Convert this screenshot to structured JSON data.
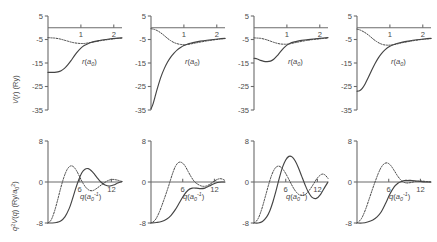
{
  "figure": {
    "rows": 2,
    "cols": 4,
    "background": "#ffffff",
    "line_color": "#444444",
    "axis_color": "#6b6b6b"
  },
  "axis_labels": {
    "top_y": "V(r) (Ry)",
    "top_y_parts": {
      "v": "V",
      "r": "r",
      "unit": "(Ry)"
    },
    "bottom_y": "q2V(q) (Ry/a02)",
    "bottom_x": "q(a0-1)",
    "top_x": "r(a0)"
  },
  "chart_data": [
    {
      "id": "top-1",
      "type": "line",
      "title": "",
      "xlabel": "r(a0)",
      "ylabel": "V(r) (Ry)",
      "xlim": [
        0,
        2.25
      ],
      "ylim": [
        -35,
        5
      ],
      "xticks": [
        1,
        2
      ],
      "xticklabels": [
        "1",
        "2"
      ],
      "yticks": [
        5,
        -5,
        -15,
        -25,
        -35
      ],
      "yticklabels": [
        "5",
        "-5",
        "-15",
        "-25",
        "-35"
      ],
      "grid": false,
      "series": [
        {
          "name": "pseudopotential",
          "style": "solid",
          "x": [
            0.0,
            0.1,
            0.2,
            0.3,
            0.4,
            0.5,
            0.6,
            0.7,
            0.8,
            0.9,
            1.0,
            1.1,
            1.2,
            1.3,
            1.4,
            1.5,
            1.6,
            1.75,
            1.9,
            2.05,
            2.25
          ],
          "y": [
            -19.0,
            -19.0,
            -19.0,
            -18.8,
            -18.3,
            -17.3,
            -15.8,
            -14.0,
            -12.0,
            -10.2,
            -8.7,
            -7.6,
            -6.9,
            -6.3,
            -5.9,
            -5.6,
            -5.3,
            -5.0,
            -4.7,
            -4.5,
            -4.3
          ]
        },
        {
          "name": "all-electron",
          "style": "dotted",
          "x": [
            0.0,
            0.1,
            0.2,
            0.3,
            0.4,
            0.5,
            0.6,
            0.7,
            0.8,
            0.9,
            1.0,
            1.1,
            1.2,
            1.3,
            1.4,
            1.5,
            1.6,
            1.75,
            1.9,
            2.05,
            2.25
          ],
          "y": [
            -4.2,
            -4.3,
            -4.4,
            -4.6,
            -4.9,
            -5.3,
            -5.7,
            -6.1,
            -6.4,
            -6.6,
            -6.7,
            -6.7,
            -6.5,
            -6.3,
            -6.0,
            -5.8,
            -5.5,
            -5.2,
            -4.9,
            -4.6,
            -4.4
          ]
        }
      ]
    },
    {
      "id": "top-2",
      "type": "line",
      "title": "",
      "xlabel": "r(a0)",
      "ylabel": "V(r) (Ry)",
      "xlim": [
        0,
        2.25
      ],
      "ylim": [
        -35,
        5
      ],
      "xticks": [
        1,
        2
      ],
      "xticklabels": [
        "1",
        "2"
      ],
      "yticks": [
        5,
        -5,
        -15,
        -25,
        -35
      ],
      "yticklabels": [
        "5",
        "-5",
        "-15",
        "-25",
        "-35"
      ],
      "grid": false,
      "series": [
        {
          "name": "pseudopotential",
          "style": "solid",
          "x": [
            0.0,
            0.06,
            0.12,
            0.2,
            0.3,
            0.4,
            0.5,
            0.6,
            0.7,
            0.8,
            0.9,
            1.0,
            1.1,
            1.2,
            1.35,
            1.5,
            1.7,
            1.9,
            2.1,
            2.25
          ],
          "y": [
            -34.5,
            -32.5,
            -29.5,
            -25.5,
            -21.0,
            -17.5,
            -14.7,
            -12.5,
            -10.8,
            -9.4,
            -8.4,
            -7.6,
            -7.0,
            -6.6,
            -6.1,
            -5.7,
            -5.3,
            -5.0,
            -4.7,
            -4.5
          ]
        },
        {
          "name": "all-electron",
          "style": "dotted",
          "x": [
            0.0,
            0.1,
            0.2,
            0.3,
            0.4,
            0.5,
            0.6,
            0.7,
            0.8,
            0.9,
            1.0,
            1.1,
            1.2,
            1.35,
            1.5,
            1.7,
            1.9,
            2.1,
            2.25
          ],
          "y": [
            -0.4,
            -0.7,
            -1.3,
            -2.2,
            -3.3,
            -4.5,
            -5.5,
            -6.3,
            -6.8,
            -7.1,
            -7.2,
            -7.1,
            -6.9,
            -6.5,
            -6.1,
            -5.6,
            -5.2,
            -4.8,
            -4.6
          ]
        }
      ]
    },
    {
      "id": "top-3",
      "type": "line",
      "title": "",
      "xlabel": "r(a0)",
      "ylabel": "V(r) (Ry)",
      "xlim": [
        0,
        2.25
      ],
      "ylim": [
        -35,
        5
      ],
      "xticks": [
        1,
        2
      ],
      "xticklabels": [
        "1",
        "2"
      ],
      "yticks": [
        5,
        -5,
        -15,
        -25,
        -35
      ],
      "yticklabels": [
        "5",
        "-5",
        "-15",
        "-25",
        "-35"
      ],
      "grid": false,
      "series": [
        {
          "name": "pseudopotential",
          "style": "solid",
          "x": [
            0.0,
            0.1,
            0.2,
            0.3,
            0.4,
            0.5,
            0.6,
            0.7,
            0.8,
            0.9,
            1.0,
            1.1,
            1.2,
            1.3,
            1.45,
            1.6,
            1.8,
            2.0,
            2.25
          ],
          "y": [
            -13.0,
            -13.3,
            -13.9,
            -14.3,
            -14.4,
            -14.2,
            -13.4,
            -12.0,
            -10.3,
            -8.7,
            -7.4,
            -6.6,
            -6.1,
            -5.8,
            -5.4,
            -5.1,
            -4.8,
            -4.5,
            -4.2
          ]
        },
        {
          "name": "all-electron",
          "style": "dotted",
          "x": [
            0.0,
            0.1,
            0.2,
            0.3,
            0.4,
            0.5,
            0.6,
            0.7,
            0.8,
            0.9,
            1.0,
            1.1,
            1.2,
            1.3,
            1.45,
            1.6,
            1.8,
            2.0,
            2.25
          ],
          "y": [
            -4.3,
            -4.4,
            -4.5,
            -4.8,
            -5.2,
            -5.7,
            -6.2,
            -6.6,
            -6.9,
            -7.0,
            -7.0,
            -6.8,
            -6.5,
            -6.2,
            -5.8,
            -5.4,
            -5.0,
            -4.7,
            -4.4
          ]
        }
      ]
    },
    {
      "id": "top-4",
      "type": "line",
      "title": "",
      "xlabel": "r(a0)",
      "ylabel": "V(r) (Ry)",
      "xlim": [
        0,
        2.25
      ],
      "ylim": [
        -35,
        5
      ],
      "xticks": [
        1,
        2
      ],
      "xticklabels": [
        "1",
        "2"
      ],
      "yticks": [
        5,
        -5,
        -15,
        -25,
        -35
      ],
      "yticklabels": [
        "5",
        "-5",
        "-15",
        "-25",
        "-35"
      ],
      "grid": false,
      "series": [
        {
          "name": "pseudopotential",
          "style": "solid",
          "x": [
            0.0,
            0.08,
            0.16,
            0.25,
            0.35,
            0.45,
            0.55,
            0.65,
            0.75,
            0.85,
            1.0,
            1.15,
            1.3,
            1.5,
            1.7,
            1.9,
            2.1,
            2.25
          ],
          "y": [
            -27.0,
            -26.8,
            -25.8,
            -23.8,
            -21.0,
            -18.0,
            -15.2,
            -12.8,
            -10.9,
            -9.4,
            -7.9,
            -7.0,
            -6.4,
            -5.8,
            -5.3,
            -5.0,
            -4.7,
            -4.5
          ]
        },
        {
          "name": "all-electron",
          "style": "dotted",
          "x": [
            0.0,
            0.1,
            0.2,
            0.3,
            0.4,
            0.5,
            0.6,
            0.7,
            0.8,
            0.9,
            1.0,
            1.1,
            1.25,
            1.4,
            1.6,
            1.85,
            2.1,
            2.25
          ],
          "y": [
            -0.6,
            -1.0,
            -1.7,
            -2.6,
            -3.7,
            -4.9,
            -5.9,
            -6.7,
            -7.2,
            -7.4,
            -7.4,
            -7.2,
            -6.8,
            -6.3,
            -5.8,
            -5.2,
            -4.8,
            -4.6
          ]
        }
      ]
    },
    {
      "id": "bottom-1",
      "type": "line",
      "title": "",
      "xlabel": "q(a0-1)",
      "ylabel": "q2V(q) (Ry/a02)",
      "xlim": [
        0,
        14
      ],
      "ylim": [
        -8,
        8
      ],
      "xticks": [
        6,
        12
      ],
      "xticklabels": [
        "6",
        "12"
      ],
      "yticks": [
        8,
        0,
        -8
      ],
      "yticklabels": [
        "8",
        "0",
        "-8"
      ],
      "grid": false,
      "series": [
        {
          "name": "pseudopotential",
          "style": "solid",
          "x": [
            0.0,
            0.8,
            1.6,
            2.4,
            3.2,
            4.0,
            4.6,
            5.2,
            5.8,
            6.4,
            7.0,
            7.6,
            8.2,
            8.8,
            9.4,
            10.0,
            10.8,
            11.6,
            12.4,
            13.2,
            14.0
          ],
          "y": [
            -8.0,
            -8.0,
            -7.9,
            -7.6,
            -6.8,
            -5.2,
            -3.4,
            -1.4,
            0.4,
            1.8,
            2.5,
            2.6,
            2.2,
            1.5,
            0.7,
            0.0,
            -0.6,
            -0.8,
            -0.6,
            -0.2,
            0.1
          ]
        },
        {
          "name": "all-electron",
          "style": "dotted",
          "x": [
            0.0,
            0.6,
            1.2,
            1.8,
            2.4,
            3.0,
            3.6,
            4.2,
            4.8,
            5.4,
            6.0,
            6.6,
            7.2,
            7.8,
            8.4,
            9.0,
            9.8,
            10.6,
            11.4,
            12.2,
            13.0,
            14.0
          ],
          "y": [
            -8.0,
            -7.4,
            -5.8,
            -3.6,
            -1.2,
            0.9,
            2.4,
            3.1,
            3.0,
            2.2,
            1.0,
            -0.2,
            -1.1,
            -1.6,
            -1.7,
            -1.4,
            -0.8,
            -0.2,
            0.3,
            0.5,
            0.4,
            0.1
          ]
        }
      ]
    },
    {
      "id": "bottom-2",
      "type": "line",
      "title": "",
      "xlabel": "q(a0-1)",
      "ylabel": "q2V(q) (Ry/a02)",
      "xlim": [
        0,
        14
      ],
      "ylim": [
        -8,
        8
      ],
      "xticks": [
        6,
        12
      ],
      "xticklabels": [
        "6",
        "12"
      ],
      "yticks": [
        8,
        0,
        -8
      ],
      "yticklabels": [
        "8",
        "0",
        "-8"
      ],
      "grid": false,
      "series": [
        {
          "name": "pseudopotential",
          "style": "solid",
          "x": [
            0.0,
            1.0,
            2.0,
            3.0,
            3.8,
            4.6,
            5.4,
            6.2,
            7.0,
            7.8,
            8.6,
            9.4,
            10.2,
            11.0,
            11.8,
            12.6,
            13.4,
            14.0
          ],
          "y": [
            -8.0,
            -7.9,
            -7.7,
            -7.2,
            -6.5,
            -5.4,
            -4.0,
            -2.6,
            -1.6,
            -1.2,
            -1.2,
            -1.3,
            -1.2,
            -0.8,
            -0.4,
            -0.1,
            0.0,
            0.0
          ]
        },
        {
          "name": "all-electron",
          "style": "dotted",
          "x": [
            0.0,
            0.8,
            1.6,
            2.4,
            3.2,
            4.0,
            4.6,
            5.2,
            5.8,
            6.4,
            7.0,
            7.6,
            8.2,
            8.8,
            9.6,
            10.4,
            11.2,
            12.0,
            12.8,
            13.4,
            14.0
          ],
          "y": [
            -8.0,
            -7.4,
            -5.8,
            -3.6,
            -1.2,
            1.4,
            3.0,
            3.8,
            3.8,
            3.2,
            2.1,
            1.0,
            0.1,
            -0.4,
            -0.8,
            -0.8,
            -0.4,
            0.2,
            0.6,
            0.6,
            0.3
          ]
        }
      ]
    },
    {
      "id": "bottom-3",
      "type": "line",
      "title": "",
      "xlabel": "q(a0-1)",
      "ylabel": "q2V(q) (Ry/a02)",
      "xlim": [
        0,
        14
      ],
      "ylim": [
        -8,
        8
      ],
      "xticks": [
        6,
        12
      ],
      "xticklabels": [
        "6",
        "12"
      ],
      "yticks": [
        8,
        0,
        -8
      ],
      "yticklabels": [
        "8",
        "0",
        "-8"
      ],
      "grid": false,
      "series": [
        {
          "name": "pseudopotential",
          "style": "solid",
          "x": [
            0.0,
            0.8,
            1.6,
            2.4,
            3.0,
            3.6,
            4.2,
            4.8,
            5.4,
            6.0,
            6.6,
            7.2,
            7.8,
            8.4,
            9.0,
            9.6,
            10.2,
            11.0,
            11.8,
            12.6,
            13.4,
            14.0
          ],
          "y": [
            -8.0,
            -8.0,
            -7.7,
            -6.8,
            -5.6,
            -3.8,
            -1.6,
            0.8,
            2.9,
            4.3,
            5.0,
            4.9,
            4.1,
            2.8,
            1.2,
            -0.4,
            -1.8,
            -3.0,
            -3.2,
            -2.4,
            -1.0,
            0.0
          ]
        },
        {
          "name": "all-electron",
          "style": "dotted",
          "x": [
            0.0,
            0.7,
            1.4,
            2.1,
            2.8,
            3.4,
            4.0,
            4.6,
            5.2,
            5.8,
            6.4,
            7.0,
            7.6,
            8.2,
            8.8,
            9.6,
            10.4,
            11.2,
            12.0,
            12.8,
            13.4,
            14.0
          ],
          "y": [
            -8.0,
            -7.3,
            -5.5,
            -3.0,
            -0.4,
            1.5,
            2.7,
            3.1,
            2.8,
            2.0,
            0.9,
            -0.3,
            -1.4,
            -2.2,
            -2.6,
            -2.5,
            -1.7,
            -0.5,
            0.8,
            1.5,
            1.4,
            0.7
          ]
        }
      ]
    },
    {
      "id": "bottom-4",
      "type": "line",
      "title": "",
      "xlabel": "q(a0-1)",
      "ylabel": "q2V(q) (Ry/a02)",
      "xlim": [
        0,
        14
      ],
      "ylim": [
        -8,
        8
      ],
      "xticks": [
        6,
        12
      ],
      "xticklabels": [
        "6",
        "12"
      ],
      "yticks": [
        8,
        0,
        -8
      ],
      "yticklabels": [
        "8",
        "0",
        "-8"
      ],
      "grid": false,
      "series": [
        {
          "name": "pseudopotential",
          "style": "solid",
          "x": [
            0.0,
            1.0,
            2.0,
            3.0,
            3.8,
            4.6,
            5.4,
            6.2,
            7.0,
            7.8,
            8.4,
            9.0,
            9.6,
            10.4,
            11.2,
            12.0,
            12.8,
            14.0
          ],
          "y": [
            -8.0,
            -8.0,
            -7.8,
            -7.4,
            -6.8,
            -5.8,
            -4.2,
            -2.4,
            -1.0,
            -0.2,
            0.1,
            0.3,
            0.3,
            0.3,
            0.2,
            0.1,
            0.0,
            0.0
          ]
        },
        {
          "name": "all-electron",
          "style": "dotted",
          "x": [
            0.0,
            0.8,
            1.6,
            2.4,
            3.2,
            4.0,
            4.6,
            5.2,
            5.8,
            6.4,
            7.0,
            7.6,
            8.2,
            8.8,
            9.4,
            10.2,
            11.0,
            12.0,
            13.0,
            14.0
          ],
          "y": [
            -8.0,
            -7.2,
            -5.4,
            -3.0,
            -0.6,
            1.6,
            2.9,
            3.6,
            3.7,
            3.2,
            2.3,
            1.3,
            0.5,
            0.0,
            -0.2,
            -0.1,
            0.1,
            0.2,
            0.1,
            0.0
          ]
        }
      ]
    }
  ]
}
